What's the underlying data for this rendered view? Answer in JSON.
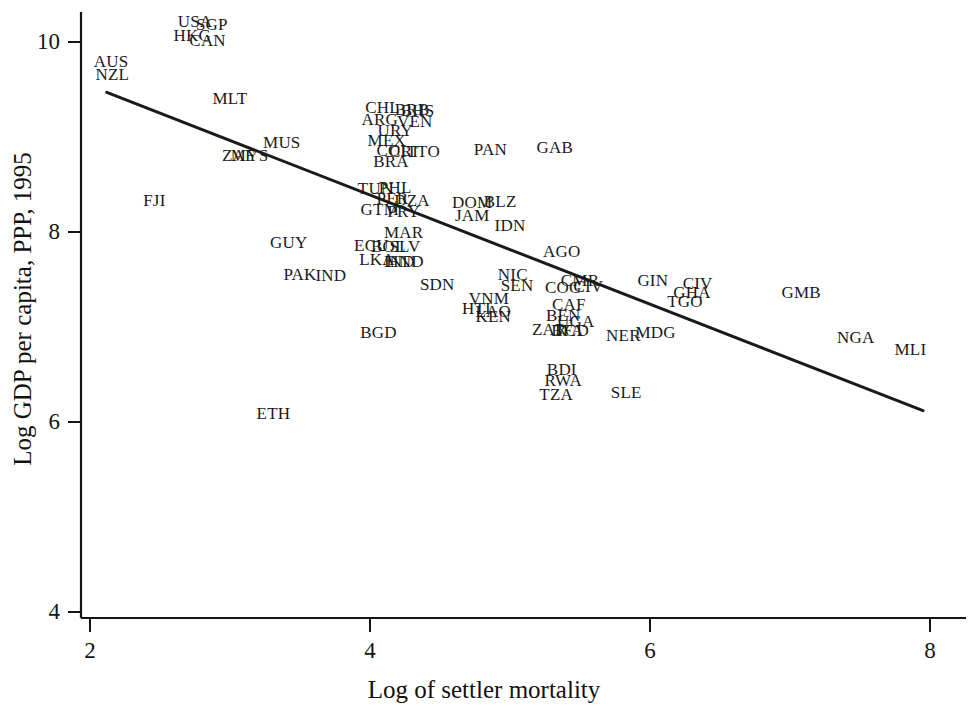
{
  "chart_data": {
    "type": "scatter",
    "title": "",
    "xlabel": "Log of settler mortality",
    "ylabel": "Log GDP per capita, PPP, 1995",
    "xlim": [
      2,
      8
    ],
    "ylim": [
      4,
      10
    ],
    "xticks": [
      2,
      4,
      6,
      8
    ],
    "yticks": [
      4,
      6,
      8,
      10
    ],
    "xtick_labels": [
      "2",
      "4",
      "6",
      "8"
    ],
    "ytick_labels": [
      "4",
      "6",
      "8",
      "10"
    ],
    "grid": false,
    "legend": null,
    "marker_style": "text-label",
    "fit_line": {
      "label": "linear fit",
      "x": [
        2.12,
        7.95
      ],
      "y": [
        9.47,
        6.12
      ],
      "color": "#1a1a1a",
      "width": 3
    },
    "points": [
      {
        "label": "AUS",
        "x": 2.15,
        "y": 9.8
      },
      {
        "label": "NZL",
        "x": 2.16,
        "y": 9.66
      },
      {
        "label": "USA",
        "x": 2.75,
        "y": 10.22
      },
      {
        "label": "SGP",
        "x": 2.87,
        "y": 10.19
      },
      {
        "label": "HKG",
        "x": 2.73,
        "y": 10.07
      },
      {
        "label": "CAN",
        "x": 2.84,
        "y": 10.02
      },
      {
        "label": "MLT",
        "x": 3.0,
        "y": 9.41
      },
      {
        "label": "MUS",
        "x": 3.37,
        "y": 8.95
      },
      {
        "label": "ZAF",
        "x": 3.06,
        "y": 8.81
      },
      {
        "label": "MYS",
        "x": 3.14,
        "y": 8.81
      },
      {
        "label": "FJI",
        "x": 2.46,
        "y": 8.34
      },
      {
        "label": "GUY",
        "x": 3.42,
        "y": 7.9
      },
      {
        "label": "PAK",
        "x": 3.5,
        "y": 7.56
      },
      {
        "label": "IND",
        "x": 3.72,
        "y": 7.55
      },
      {
        "label": "ETH",
        "x": 3.31,
        "y": 6.1
      },
      {
        "label": "CHL",
        "x": 4.09,
        "y": 9.32
      },
      {
        "label": "BRB",
        "x": 4.3,
        "y": 9.3
      },
      {
        "label": "BHS",
        "x": 4.34,
        "y": 9.28
      },
      {
        "label": "ARG",
        "x": 4.07,
        "y": 9.19
      },
      {
        "label": "VEN",
        "x": 4.32,
        "y": 9.17
      },
      {
        "label": "URY",
        "x": 4.18,
        "y": 9.07
      },
      {
        "label": "MEX",
        "x": 4.12,
        "y": 8.97
      },
      {
        "label": "COL",
        "x": 4.17,
        "y": 8.86
      },
      {
        "label": "CRI",
        "x": 4.24,
        "y": 8.85
      },
      {
        "label": "TTO",
        "x": 4.38,
        "y": 8.85
      },
      {
        "label": "BRA",
        "x": 4.15,
        "y": 8.75
      },
      {
        "label": "PAN",
        "x": 4.86,
        "y": 8.87
      },
      {
        "label": "GAB",
        "x": 5.32,
        "y": 8.9
      },
      {
        "label": "TUN",
        "x": 4.04,
        "y": 8.46
      },
      {
        "label": "PHL",
        "x": 4.18,
        "y": 8.47
      },
      {
        "label": "PER",
        "x": 4.16,
        "y": 8.36
      },
      {
        "label": "DZA",
        "x": 4.3,
        "y": 8.34
      },
      {
        "label": "GTM",
        "x": 4.07,
        "y": 8.24
      },
      {
        "label": "PRY",
        "x": 4.24,
        "y": 8.22
      },
      {
        "label": "DOM",
        "x": 4.73,
        "y": 8.32
      },
      {
        "label": "BLZ",
        "x": 4.93,
        "y": 8.33
      },
      {
        "label": "JAM",
        "x": 4.73,
        "y": 8.18
      },
      {
        "label": "IDN",
        "x": 5.0,
        "y": 8.07
      },
      {
        "label": "MAR",
        "x": 4.24,
        "y": 8.0
      },
      {
        "label": "ECU",
        "x": 4.01,
        "y": 7.86
      },
      {
        "label": "BOL",
        "x": 4.13,
        "y": 7.85
      },
      {
        "label": "SLV",
        "x": 4.25,
        "y": 7.85
      },
      {
        "label": "LKA",
        "x": 4.05,
        "y": 7.72
      },
      {
        "label": "IND2",
        "x": 4.21,
        "y": 7.7
      },
      {
        "label": "HND",
        "x": 4.25,
        "y": 7.69
      },
      {
        "label": "AGO",
        "x": 5.37,
        "y": 7.8
      },
      {
        "label": "NIC",
        "x": 5.02,
        "y": 7.56
      },
      {
        "label": "SEN",
        "x": 5.05,
        "y": 7.44
      },
      {
        "label": "COG",
        "x": 5.38,
        "y": 7.42
      },
      {
        "label": "CMR",
        "x": 5.5,
        "y": 7.5
      },
      {
        "label": "CIV",
        "x": 5.56,
        "y": 7.43
      },
      {
        "label": "GIN",
        "x": 6.02,
        "y": 7.49
      },
      {
        "label": "CIV2",
        "x": 6.34,
        "y": 7.46
      },
      {
        "label": "GHA",
        "x": 6.3,
        "y": 7.37
      },
      {
        "label": "TGO",
        "x": 6.25,
        "y": 7.27
      },
      {
        "label": "GMB",
        "x": 7.08,
        "y": 7.37
      },
      {
        "label": "SDN",
        "x": 4.48,
        "y": 7.45
      },
      {
        "label": "VNM",
        "x": 4.85,
        "y": 7.31
      },
      {
        "label": "HTI",
        "x": 4.76,
        "y": 7.2
      },
      {
        "label": "LAO",
        "x": 4.88,
        "y": 7.17
      },
      {
        "label": "KEN",
        "x": 4.88,
        "y": 7.12
      },
      {
        "label": "CAF",
        "x": 5.42,
        "y": 7.24
      },
      {
        "label": "BEN",
        "x": 5.38,
        "y": 7.13
      },
      {
        "label": "UGA",
        "x": 5.47,
        "y": 7.06
      },
      {
        "label": "ZAR",
        "x": 5.28,
        "y": 6.98
      },
      {
        "label": "TCD",
        "x": 5.44,
        "y": 6.97
      },
      {
        "label": "BFA",
        "x": 5.41,
        "y": 6.97
      },
      {
        "label": "BGD",
        "x": 4.06,
        "y": 6.95
      },
      {
        "label": "NER",
        "x": 5.81,
        "y": 6.92
      },
      {
        "label": "MDG",
        "x": 6.04,
        "y": 6.95
      },
      {
        "label": "NGA",
        "x": 7.47,
        "y": 6.9
      },
      {
        "label": "MLI",
        "x": 7.86,
        "y": 6.77
      },
      {
        "label": "BDI",
        "x": 5.37,
        "y": 6.56
      },
      {
        "label": "RWA",
        "x": 5.38,
        "y": 6.44
      },
      {
        "label": "TZA",
        "x": 5.33,
        "y": 6.3
      },
      {
        "label": "SLE",
        "x": 5.83,
        "y": 6.32
      }
    ],
    "point_display_labels": {
      "IND2": "IND",
      "CIV2": "CIV"
    }
  },
  "axes": {
    "x_title": "Log of settler mortality",
    "y_title": "Log GDP per capita, PPP, 1995",
    "x_ticks": [
      "2",
      "4",
      "6",
      "8"
    ],
    "y_ticks": [
      "10",
      "8",
      "6",
      "4"
    ]
  },
  "colors": {
    "axis": "#141414",
    "text": "#1a1a1a",
    "fit_line": "#1a1a1a",
    "background": "#ffffff"
  }
}
